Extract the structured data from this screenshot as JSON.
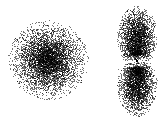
{
  "figure": {
    "width": 167,
    "height": 126,
    "background": "#ffffff",
    "dot_color": "#000000"
  },
  "orbitals": [
    {
      "name": "s-orbital",
      "shape": "sphere",
      "center": [
        48,
        60
      ],
      "radius": 40,
      "dots": 5200
    },
    {
      "name": "p-orbital",
      "shape": "dumbbell",
      "nucleus": [
        137,
        61
      ],
      "lobe_offset": 24,
      "lobe_radius_x": 19,
      "lobe_radius_y": 30,
      "dots_per_lobe": 2600,
      "nucleus_dot_size": 2
    }
  ]
}
